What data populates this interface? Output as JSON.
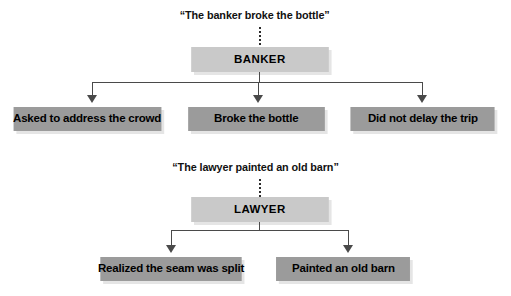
{
  "figure": {
    "colors": {
      "subject_box_fill": "#c9c9c9",
      "child_box_fill": "#9b9b9b",
      "connector_line": "#4a4a4a",
      "dotted_link": "#2b2b2b",
      "text": "#000000",
      "background": "#ffffff"
    }
  },
  "diagrams": [
    {
      "caption": "“The banker broke the bottle”",
      "subject": "BANKER",
      "children": [
        {
          "label": "Asked to address the crowd"
        },
        {
          "label": "Broke the bottle"
        },
        {
          "label": "Did not delay the trip"
        }
      ]
    },
    {
      "caption": "“The lawyer painted an old barn”",
      "subject": "LAWYER",
      "children": [
        {
          "label": "Realized the seam was split"
        },
        {
          "label": "Painted an old barn"
        }
      ]
    }
  ]
}
